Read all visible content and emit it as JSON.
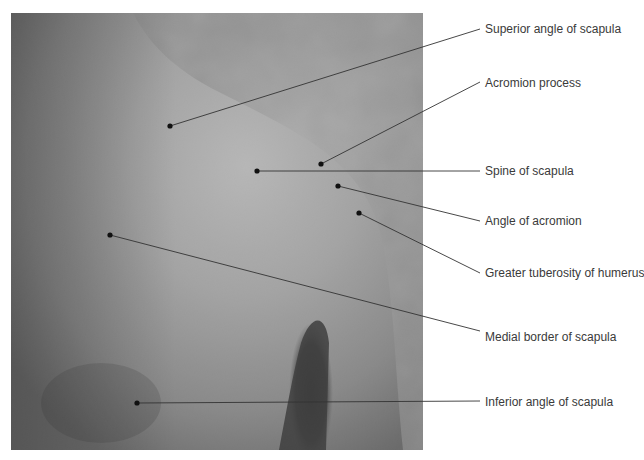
{
  "figure": {
    "line_color": "#333333",
    "point_color": "#111111"
  },
  "labels": [
    {
      "text": "Superior angle of scapula",
      "point": [
        170,
        126
      ],
      "end": [
        480,
        29
      ],
      "label_x": 485,
      "label_y": 22
    },
    {
      "text": "Acromion process",
      "point": [
        321,
        164
      ],
      "end": [
        480,
        82
      ],
      "label_x": 485,
      "label_y": 76
    },
    {
      "text": "Spine of scapula",
      "point": [
        257,
        171
      ],
      "end": [
        480,
        171
      ],
      "label_x": 485,
      "label_y": 164
    },
    {
      "text": "Angle of acromion",
      "point": [
        338,
        186
      ],
      "end": [
        480,
        221
      ],
      "label_x": 485,
      "label_y": 214
    },
    {
      "text": "Greater tuberosity of humerus",
      "point": [
        359,
        213
      ],
      "end": [
        480,
        273
      ],
      "label_x": 485,
      "label_y": 266
    },
    {
      "text": "Medial border of scapula",
      "point": [
        110,
        235
      ],
      "end": [
        480,
        331
      ],
      "label_x": 485,
      "label_y": 330
    },
    {
      "text": "Inferior angle of scapula",
      "point": [
        137,
        403
      ],
      "end": [
        480,
        401
      ],
      "label_x": 485,
      "label_y": 395
    }
  ]
}
